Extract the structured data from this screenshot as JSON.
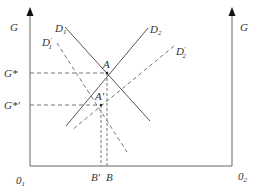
{
  "diagram": {
    "colors": {
      "axis": "#666666",
      "line": "#555555",
      "dash": "#777777",
      "text": "#333333",
      "background": "#ffffff"
    },
    "axes": {
      "left_label": "G",
      "right_label": "G",
      "origin_left": "0",
      "origin_left_sub": "1",
      "origin_right": "0",
      "origin_right_sub": "2"
    },
    "curves": [
      {
        "id": "D1",
        "label": "D",
        "sub": "1",
        "prime": "",
        "style": "solid"
      },
      {
        "id": "D2",
        "label": "D",
        "sub": "2",
        "prime": "",
        "style": "solid"
      },
      {
        "id": "D1prime",
        "label": "D",
        "sub": "1",
        "prime": "′",
        "style": "dashed"
      },
      {
        "id": "D2prime",
        "label": "D",
        "sub": "2",
        "prime": "′",
        "style": "dashed"
      }
    ],
    "points": {
      "A": "A",
      "A_prime": "A′",
      "G_star": "G*",
      "G_star_prime": "G*′",
      "B": "B",
      "B_prime": "B′"
    }
  }
}
